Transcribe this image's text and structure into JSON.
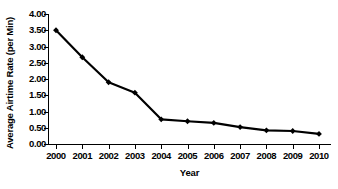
{
  "chart_data": {
    "type": "line",
    "title": "",
    "xlabel": "Year",
    "ylabel": "Average Airtime Rate (per Min)",
    "categories": [
      "2000",
      "2001",
      "2002",
      "2003",
      "2004",
      "2005",
      "2006",
      "2007",
      "2008",
      "2009",
      "2010"
    ],
    "x": [
      2000,
      2001,
      2002,
      2003,
      2004,
      2005,
      2006,
      2007,
      2008,
      2009,
      2010
    ],
    "values": [
      3.5,
      2.67,
      1.9,
      1.58,
      0.76,
      0.7,
      0.65,
      0.52,
      0.42,
      0.4,
      0.31
    ],
    "series": [
      {
        "name": "Average Airtime Rate",
        "values": [
          3.5,
          2.67,
          1.9,
          1.58,
          0.76,
          0.7,
          0.65,
          0.52,
          0.42,
          0.4,
          0.31
        ]
      }
    ],
    "ylim": [
      0.0,
      4.0
    ],
    "xlim": [
      2000,
      2010
    ],
    "ytick_labels": [
      "0.00",
      "0.50",
      "1.00",
      "1.50",
      "2.00",
      "2.50",
      "3.00",
      "3.50",
      "4.00"
    ],
    "ytick_values": [
      0.0,
      0.5,
      1.0,
      1.5,
      2.0,
      2.5,
      3.0,
      3.5,
      4.0
    ],
    "xtick_labels": [
      "2000",
      "2001",
      "2002",
      "2003",
      "2004",
      "2005",
      "2006",
      "2007",
      "2008",
      "2009",
      "2010"
    ],
    "grid": false,
    "legend": null,
    "legend_position": "none",
    "marker": "diamond",
    "line_color": "#000000",
    "marker_color": "#000000",
    "background_color": "#ffffff"
  }
}
